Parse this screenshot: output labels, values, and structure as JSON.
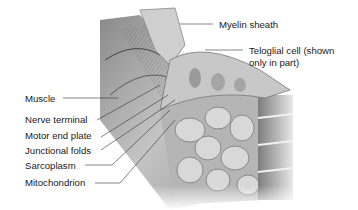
{
  "figure": {
    "labels": {
      "myelin_sheath": "Myelin sheath",
      "teloglial_line1": "Teloglial cell (shown",
      "teloglial_line2": "only in part)",
      "muscle": "Muscle",
      "nerve_terminal": "Nerve terminal",
      "motor_end_plate": "Motor end plate",
      "junctional_folds": "Junctional folds",
      "sarcoplasm": "Sarcoplasm",
      "mitochondrion": "Mitochondrion"
    },
    "colors": {
      "background": "#ffffff",
      "text": "#1a1a1a",
      "leader_line": "#333333",
      "tissue_light": "#d9d9d9",
      "tissue_mid": "#a8a8a8",
      "tissue_dark": "#5e5e5e"
    }
  }
}
